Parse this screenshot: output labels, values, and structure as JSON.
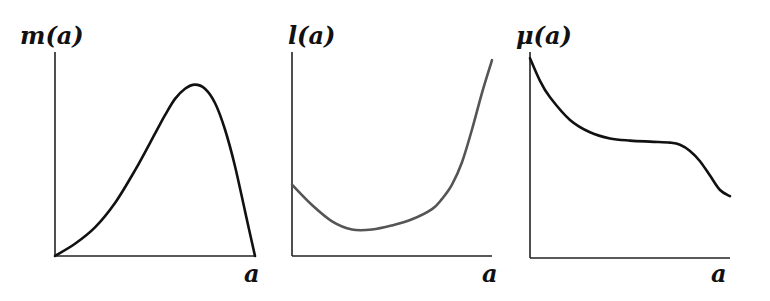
{
  "chart_data": [
    {
      "type": "line",
      "title": "m(a)",
      "ylabel": "m(a)",
      "xlabel": "a",
      "xlim": [
        0,
        1
      ],
      "ylim": [
        0,
        1
      ],
      "grid": false,
      "color": "#111111",
      "x": [
        0,
        0.1,
        0.2,
        0.3,
        0.4,
        0.5,
        0.55,
        0.6,
        0.65,
        0.7,
        0.75,
        0.8,
        0.85,
        0.9,
        0.95,
        1.0
      ],
      "y": [
        0,
        0.06,
        0.14,
        0.26,
        0.42,
        0.6,
        0.69,
        0.77,
        0.82,
        0.84,
        0.82,
        0.75,
        0.62,
        0.44,
        0.22,
        0
      ]
    },
    {
      "type": "line",
      "title": "l(a)",
      "ylabel": "l(a)",
      "xlabel": "a",
      "xlim": [
        0,
        1
      ],
      "ylim": [
        0,
        1
      ],
      "grid": false,
      "color": "#555555",
      "x": [
        0,
        0.1,
        0.2,
        0.3,
        0.4,
        0.5,
        0.6,
        0.7,
        0.75,
        0.8,
        0.85,
        0.9,
        0.95,
        1.0
      ],
      "y": [
        0.35,
        0.25,
        0.17,
        0.13,
        0.13,
        0.15,
        0.18,
        0.23,
        0.28,
        0.35,
        0.46,
        0.62,
        0.8,
        0.96
      ]
    },
    {
      "type": "line",
      "title": "μ(a)",
      "ylabel": "μ(a)",
      "xlabel": "a",
      "xlim": [
        0,
        1
      ],
      "ylim": [
        0,
        1
      ],
      "grid": false,
      "color": "#111111",
      "x": [
        0,
        0.05,
        0.1,
        0.2,
        0.3,
        0.4,
        0.5,
        0.6,
        0.7,
        0.75,
        0.8,
        0.85,
        0.9,
        0.95,
        1.0
      ],
      "y": [
        0.97,
        0.86,
        0.78,
        0.67,
        0.61,
        0.58,
        0.57,
        0.565,
        0.56,
        0.55,
        0.52,
        0.47,
        0.4,
        0.33,
        0.3
      ]
    }
  ]
}
